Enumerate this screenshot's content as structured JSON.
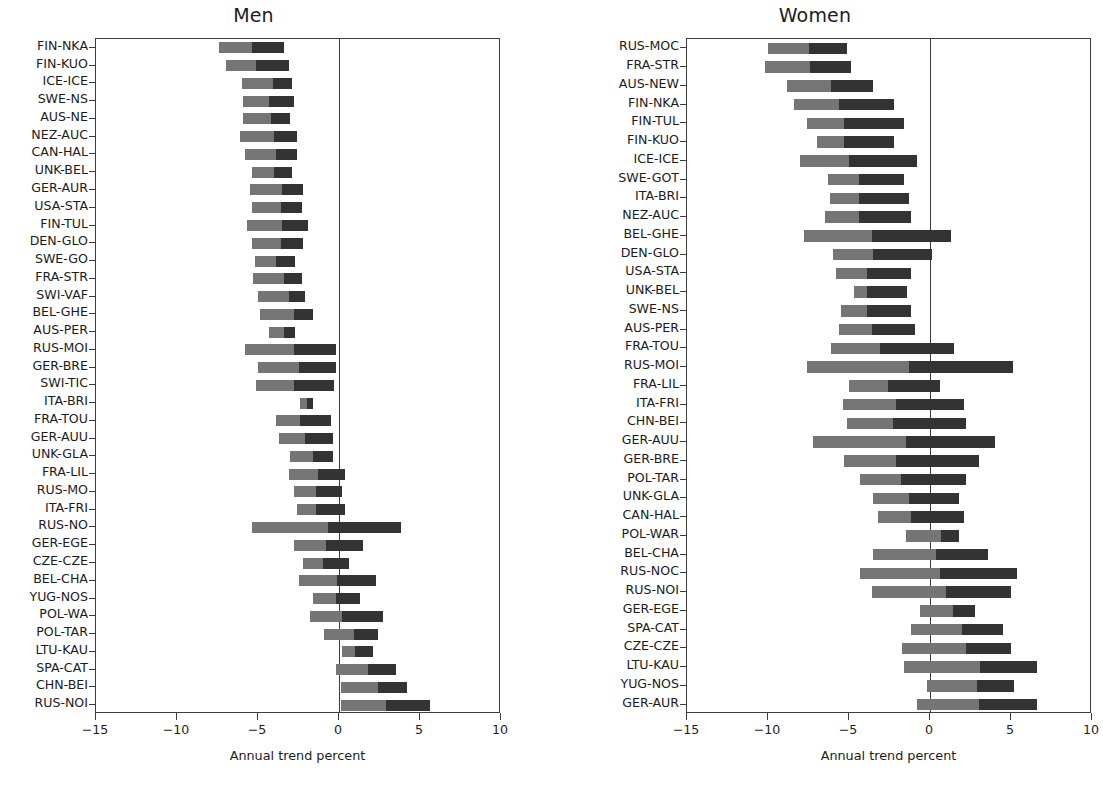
{
  "figure": {
    "width": 1103,
    "height": 790,
    "background": "#ffffff"
  },
  "colors": {
    "segment_negative": "#757575",
    "segment_positive": "#333333",
    "axis": "#3c3c3c",
    "text": "#1c1c1c"
  },
  "axis": {
    "xlabel": "Annual trend percent",
    "xlim": [
      -15,
      10
    ],
    "xticks": [
      -15,
      -10,
      -5,
      0,
      10
    ],
    "xtick_labels": [
      "−15",
      "−10",
      "−5",
      "0",
      "5",
      "10"
    ],
    "xtick_values": [
      -15,
      -10,
      -5,
      0,
      5,
      10
    ],
    "grid": false
  },
  "chart_data": {
    "type": "bar",
    "subtype": "diverging-stacked-horizontal",
    "title": "",
    "xlabel": "Annual trend percent",
    "ylabel": "",
    "xlim": [
      -15,
      10
    ],
    "xticks": [
      -15,
      -10,
      -5,
      0,
      5,
      10
    ],
    "grid": false,
    "legend": [],
    "series": [
      {
        "name": "early-period segment",
        "color": "#757575"
      },
      {
        "name": "late-period segment",
        "color": "#333333"
      }
    ],
    "panels": [
      {
        "title": "Men",
        "categories": [
          "FIN-NKA",
          "FIN-KUO",
          "ICE-ICE",
          "SWE-NS",
          "AUS-NE",
          "NEZ-AUC",
          "CAN-HAL",
          "UNK-BEL",
          "GER-AUR",
          "USA-STA",
          "FIN-TUL",
          "DEN-GLO",
          "SWE-GO",
          "FRA-STR",
          "SWI-VAF",
          "BEL-GHE",
          "AUS-PER",
          "RUS-MOI",
          "GER-BRE",
          "SWI-TIC",
          "ITA-BRI",
          "FRA-TOU",
          "GER-AUU",
          "UNK-GLA",
          "FRA-LIL",
          "RUS-MO",
          "ITA-FRI",
          "RUS-NO",
          "GER-EGE",
          "CZE-CZE",
          "BEL-CHA",
          "YUG-NOS",
          "POL-WA",
          "POL-TAR",
          "LTU-KAU",
          "SPA-CAT",
          "CHN-BEI",
          "RUS-NOI"
        ],
        "bars": [
          {
            "category": "FIN-NKA",
            "start": -7.4,
            "split": -5.4,
            "end": -3.4
          },
          {
            "category": "FIN-KUO",
            "start": -7.0,
            "split": -5.1,
            "end": -3.1
          },
          {
            "category": "ICE-ICE",
            "start": -6.0,
            "split": -4.1,
            "end": -2.9
          },
          {
            "category": "SWE-NS",
            "start": -5.9,
            "split": -4.3,
            "end": -2.8
          },
          {
            "category": "AUS-NE",
            "start": -5.9,
            "split": -4.2,
            "end": -3.0
          },
          {
            "category": "NEZ-AUC",
            "start": -6.1,
            "split": -4.0,
            "end": -2.6
          },
          {
            "category": "CAN-HAL",
            "start": -5.8,
            "split": -3.9,
            "end": -2.6
          },
          {
            "category": "UNK-BEL",
            "start": -5.4,
            "split": -4.0,
            "end": -2.9
          },
          {
            "category": "GER-AUR",
            "start": -5.5,
            "split": -3.5,
            "end": -2.2
          },
          {
            "category": "USA-STA",
            "start": -5.4,
            "split": -3.6,
            "end": -2.3
          },
          {
            "category": "FIN-TUL",
            "start": -5.7,
            "split": -3.5,
            "end": -1.9
          },
          {
            "category": "DEN-GLO",
            "start": -5.4,
            "split": -3.6,
            "end": -2.2
          },
          {
            "category": "SWE-GO",
            "start": -5.2,
            "split": -3.9,
            "end": -2.7
          },
          {
            "category": "FRA-STR",
            "start": -5.3,
            "split": -3.4,
            "end": -2.3
          },
          {
            "category": "SWI-VAF",
            "start": -5.0,
            "split": -3.1,
            "end": -2.1
          },
          {
            "category": "BEL-GHE",
            "start": -4.9,
            "split": -2.8,
            "end": -1.6
          },
          {
            "category": "AUS-PER",
            "start": -4.3,
            "split": -3.4,
            "end": -2.7
          },
          {
            "category": "RUS-MOI",
            "start": -5.8,
            "split": -2.8,
            "end": -0.2
          },
          {
            "category": "GER-BRE",
            "start": -5.0,
            "split": -2.5,
            "end": -0.2
          },
          {
            "category": "SWI-TIC",
            "start": -5.1,
            "split": -2.8,
            "end": -0.3
          },
          {
            "category": "ITA-BRI",
            "start": -2.4,
            "split": -2.0,
            "end": -1.6
          },
          {
            "category": "FRA-TOU",
            "start": -3.9,
            "split": -2.4,
            "end": -0.5
          },
          {
            "category": "GER-AUU",
            "start": -3.7,
            "split": -2.1,
            "end": -0.4
          },
          {
            "category": "UNK-GLA",
            "start": -3.0,
            "split": -1.6,
            "end": -0.4
          },
          {
            "category": "FRA-LIL",
            "start": -3.1,
            "split": -1.3,
            "end": 0.4
          },
          {
            "category": "RUS-MO",
            "start": -2.8,
            "split": -1.4,
            "end": 0.2
          },
          {
            "category": "ITA-FRI",
            "start": -2.6,
            "split": -1.4,
            "end": 0.4
          },
          {
            "category": "RUS-NO",
            "start": -5.4,
            "split": -0.7,
            "end": 3.8
          },
          {
            "category": "GER-EGE",
            "start": -2.8,
            "split": -0.8,
            "end": 1.5
          },
          {
            "category": "CZE-CZE",
            "start": -2.2,
            "split": -1.0,
            "end": 0.6
          },
          {
            "category": "BEL-CHA",
            "start": -2.5,
            "split": -0.1,
            "end": 2.3
          },
          {
            "category": "YUG-NOS",
            "start": -1.6,
            "split": -0.2,
            "end": 1.3
          },
          {
            "category": "POL-WA",
            "start": -1.8,
            "split": 0.2,
            "end": 2.7
          },
          {
            "category": "POL-TAR",
            "start": -0.9,
            "split": 0.9,
            "end": 2.4
          },
          {
            "category": "LTU-KAU",
            "start": 0.2,
            "split": 1.0,
            "end": 2.1
          },
          {
            "category": "SPA-CAT",
            "start": -0.2,
            "split": 1.8,
            "end": 3.5
          },
          {
            "category": "CHN-BEI",
            "start": 0.1,
            "split": 2.4,
            "end": 4.2
          },
          {
            "category": "RUS-NOI",
            "start": 0.1,
            "split": 2.9,
            "end": 5.6
          }
        ]
      },
      {
        "title": "Women",
        "categories": [
          "RUS-MOC",
          "FRA-STR",
          "AUS-NEW",
          "FIN-NKA",
          "FIN-TUL",
          "FIN-KUO",
          "ICE-ICE",
          "SWE-GOT",
          "ITA-BRI",
          "NEZ-AUC",
          "BEL-GHE",
          "DEN-GLO",
          "USA-STA",
          "UNK-BEL",
          "SWE-NS",
          "AUS-PER",
          "FRA-TOU",
          "RUS-MOI",
          "FRA-LIL",
          "ITA-FRI",
          "CHN-BEI",
          "GER-AUU",
          "GER-BRE",
          "POL-TAR",
          "UNK-GLA",
          "CAN-HAL",
          "POL-WAR",
          "BEL-CHA",
          "RUS-NOC",
          "RUS-NOI",
          "GER-EGE",
          "SPA-CAT",
          "CZE-CZE",
          "LTU-KAU",
          "YUG-NOS",
          "GER-AUR"
        ],
        "bars": [
          {
            "category": "RUS-MOC",
            "start": -10.0,
            "split": -7.5,
            "end": -5.1
          },
          {
            "category": "FRA-STR",
            "start": -10.2,
            "split": -7.4,
            "end": -4.9
          },
          {
            "category": "AUS-NEW",
            "start": -8.8,
            "split": -6.1,
            "end": -3.5
          },
          {
            "category": "FIN-NKA",
            "start": -8.4,
            "split": -5.6,
            "end": -2.2
          },
          {
            "category": "FIN-TUL",
            "start": -7.6,
            "split": -5.3,
            "end": -1.6
          },
          {
            "category": "FIN-KUO",
            "start": -7.0,
            "split": -5.3,
            "end": -2.2
          },
          {
            "category": "ICE-ICE",
            "start": -8.0,
            "split": -5.0,
            "end": -0.8
          },
          {
            "category": "SWE-GOT",
            "start": -6.3,
            "split": -4.4,
            "end": -1.6
          },
          {
            "category": "ITA-BRI",
            "start": -6.2,
            "split": -4.4,
            "end": -1.3
          },
          {
            "category": "NEZ-AUC",
            "start": -6.5,
            "split": -4.4,
            "end": -1.2
          },
          {
            "category": "BEL-GHE",
            "start": -7.8,
            "split": -3.6,
            "end": 1.3
          },
          {
            "category": "DEN-GLO",
            "start": -6.0,
            "split": -3.5,
            "end": 0.1
          },
          {
            "category": "USA-STA",
            "start": -5.8,
            "split": -3.9,
            "end": -1.2
          },
          {
            "category": "UNK-BEL",
            "start": -4.7,
            "split": -3.9,
            "end": -1.4
          },
          {
            "category": "SWE-NS",
            "start": -5.5,
            "split": -3.9,
            "end": -1.2
          },
          {
            "category": "AUS-PER",
            "start": -5.6,
            "split": -3.6,
            "end": -0.9
          },
          {
            "category": "FRA-TOU",
            "start": -6.1,
            "split": -3.1,
            "end": 1.5
          },
          {
            "category": "RUS-MOI",
            "start": -7.6,
            "split": -1.3,
            "end": 5.1
          },
          {
            "category": "FRA-LIL",
            "start": -5.0,
            "split": -2.6,
            "end": 0.6
          },
          {
            "category": "ITA-FRI",
            "start": -5.4,
            "split": -2.1,
            "end": 2.1
          },
          {
            "category": "CHN-BEI",
            "start": -5.1,
            "split": -2.3,
            "end": 2.2
          },
          {
            "category": "GER-AUU",
            "start": -7.2,
            "split": -1.5,
            "end": 4.0
          },
          {
            "category": "GER-BRE",
            "start": -5.3,
            "split": -2.1,
            "end": 3.0
          },
          {
            "category": "POL-TAR",
            "start": -4.3,
            "split": -1.8,
            "end": 2.2
          },
          {
            "category": "UNK-GLA",
            "start": -3.5,
            "split": -1.3,
            "end": 1.8
          },
          {
            "category": "CAN-HAL",
            "start": -3.2,
            "split": -1.2,
            "end": 2.1
          },
          {
            "category": "POL-WAR",
            "start": -1.5,
            "split": 0.7,
            "end": 1.8
          },
          {
            "category": "BEL-CHA",
            "start": -3.5,
            "split": 0.4,
            "end": 3.6
          },
          {
            "category": "RUS-NOC",
            "start": -4.3,
            "split": 0.6,
            "end": 5.4
          },
          {
            "category": "RUS-NOI",
            "start": -3.6,
            "split": 1.0,
            "end": 5.0
          },
          {
            "category": "GER-EGE",
            "start": -0.6,
            "split": 1.4,
            "end": 2.8
          },
          {
            "category": "SPA-CAT",
            "start": -1.2,
            "split": 2.0,
            "end": 4.5
          },
          {
            "category": "CZE-CZE",
            "start": -1.7,
            "split": 2.2,
            "end": 5.0
          },
          {
            "category": "LTU-KAU",
            "start": -1.6,
            "split": 3.1,
            "end": 6.6
          },
          {
            "category": "YUG-NOS",
            "start": -0.2,
            "split": 2.9,
            "end": 5.2
          },
          {
            "category": "GER-AUR",
            "start": -0.8,
            "split": 3.0,
            "end": 6.6
          }
        ]
      }
    ]
  }
}
